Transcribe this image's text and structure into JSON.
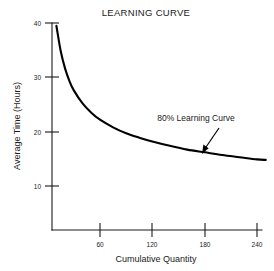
{
  "chart_data": {
    "type": "line",
    "title": "LEARNING CURVE",
    "xlabel": "Cumulative Quantity",
    "ylabel": "Average Time (Hours)",
    "xlim": [
      0,
      270
    ],
    "ylim": [
      0,
      42
    ],
    "grid": false,
    "legend": "none",
    "xticks": [
      "60",
      "120",
      "180",
      "240"
    ],
    "xtick_values": [
      60,
      120,
      180,
      240
    ],
    "yticks": [
      "10",
      "20",
      "30",
      "40"
    ],
    "ytick_values": [
      10,
      20,
      30,
      40
    ],
    "series": [
      {
        "name": "80% Learning Curve",
        "x": [
          10,
          15,
          20,
          25,
          30,
          40,
          50,
          60,
          75,
          90,
          105,
          120,
          140,
          160,
          180,
          200,
          220,
          240,
          250
        ],
        "values": [
          39.5,
          34.8,
          31.6,
          29.3,
          27.6,
          25.2,
          23.5,
          22.2,
          20.8,
          19.7,
          18.9,
          18.2,
          17.4,
          16.7,
          16.2,
          15.7,
          15.3,
          14.9,
          14.8
        ]
      }
    ],
    "annotations": [
      {
        "text": "80% Learning Curve",
        "points_to_x": 170,
        "points_to_y": 16.5
      }
    ]
  },
  "axes": {
    "title": "LEARNING CURVE",
    "x_axis_label": "Cumulative Quantity",
    "y_axis_label": "Average Time (Hours)",
    "x_tick_labels": [
      "60",
      "120",
      "180",
      "240"
    ],
    "y_tick_labels": [
      "40",
      "30",
      "20",
      "10"
    ]
  },
  "annotation": {
    "label": "80% Learning Curve"
  },
  "colors": {
    "background": "#ffffff",
    "ink": "#1a1a1a",
    "curve": "#000000"
  }
}
